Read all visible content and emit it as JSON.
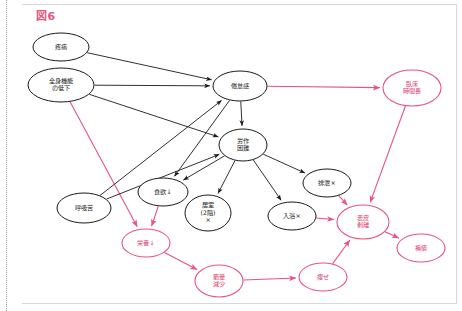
{
  "figure": {
    "label": "図6",
    "label_color": "#e8537f",
    "width": 462,
    "height": 311
  },
  "palette": {
    "black": "#1a1a1a",
    "pink": "#e8537f",
    "pink_text": "#d8406e",
    "background": "#ffffff",
    "frame": "#d8d8d8",
    "rule": "#9a9a9a"
  },
  "chart_data": {
    "type": "diagram",
    "title": "図6",
    "nodes": [
      {
        "id": "pain",
        "lines": [
          "疼痛"
        ],
        "cx": 61,
        "cy": 47,
        "rx": 28,
        "ry": 14,
        "color": "black"
      },
      {
        "id": "decline",
        "lines": [
          "全身機能",
          "の低下"
        ],
        "cx": 61,
        "cy": 85,
        "rx": 33,
        "ry": 17,
        "color": "black"
      },
      {
        "id": "fatigue",
        "lines": [
          "倦怠感"
        ],
        "cx": 240,
        "cy": 86,
        "rx": 27,
        "ry": 15,
        "color": "black"
      },
      {
        "id": "exertion",
        "lines": [
          "労作",
          "困難"
        ],
        "cx": 243,
        "cy": 145,
        "rx": 24,
        "ry": 16,
        "color": "black"
      },
      {
        "id": "bedrest",
        "lines": [
          "臥床",
          "時間長"
        ],
        "cx": 412,
        "cy": 88,
        "rx": 29,
        "ry": 18,
        "color": "pink"
      },
      {
        "id": "dyspnea",
        "lines": [
          "呼吸苦"
        ],
        "cx": 84,
        "cy": 208,
        "rx": 27,
        "ry": 15,
        "color": "black"
      },
      {
        "id": "appetite",
        "lines": [
          "食欲↓"
        ],
        "cx": 163,
        "cy": 192,
        "rx": 25,
        "ry": 14,
        "color": "black"
      },
      {
        "id": "room",
        "lines": [
          "居室",
          "(2階)",
          "×"
        ],
        "cx": 208,
        "cy": 213,
        "rx": 23,
        "ry": 18,
        "color": "black"
      },
      {
        "id": "bath",
        "lines": [
          "入浴×"
        ],
        "cx": 292,
        "cy": 216,
        "rx": 24,
        "ry": 14,
        "color": "black"
      },
      {
        "id": "toilet",
        "lines": [
          "排泄×"
        ],
        "cx": 327,
        "cy": 183,
        "rx": 24,
        "ry": 14,
        "color": "black"
      },
      {
        "id": "nutrition",
        "lines": [
          "栄養↓"
        ],
        "cx": 146,
        "cy": 243,
        "rx": 24,
        "ry": 14,
        "color": "pink"
      },
      {
        "id": "skin_tear",
        "lines": [
          "表皮",
          "剥離"
        ],
        "cx": 363,
        "cy": 222,
        "rx": 26,
        "ry": 17,
        "color": "pink"
      },
      {
        "id": "ulcer",
        "lines": [
          "褥瘡"
        ],
        "cx": 421,
        "cy": 248,
        "rx": 24,
        "ry": 14,
        "color": "pink"
      },
      {
        "id": "muscle_loss",
        "lines": [
          "筋量",
          "減少"
        ],
        "cx": 219,
        "cy": 281,
        "rx": 24,
        "ry": 16,
        "color": "pink"
      },
      {
        "id": "emaciation",
        "lines": [
          "痩せ"
        ],
        "cx": 323,
        "cy": 277,
        "rx": 24,
        "ry": 14,
        "color": "pink"
      }
    ],
    "edges": [
      {
        "from": "pain",
        "to": "fatigue",
        "color": "black"
      },
      {
        "from": "decline",
        "to": "fatigue",
        "color": "black"
      },
      {
        "from": "decline",
        "to": "exertion",
        "color": "black"
      },
      {
        "from": "decline",
        "to": "nutrition",
        "color": "pink"
      },
      {
        "from": "fatigue",
        "to": "exertion",
        "color": "black"
      },
      {
        "from": "fatigue",
        "to": "bedrest",
        "color": "pink"
      },
      {
        "from": "fatigue",
        "to": "appetite",
        "color": "black"
      },
      {
        "from": "dyspnea",
        "to": "fatigue",
        "color": "black"
      },
      {
        "from": "dyspnea",
        "to": "exertion",
        "color": "black"
      },
      {
        "from": "exertion",
        "to": "appetite",
        "color": "black"
      },
      {
        "from": "exertion",
        "to": "room",
        "color": "black"
      },
      {
        "from": "exertion",
        "to": "bath",
        "color": "black"
      },
      {
        "from": "exertion",
        "to": "toilet",
        "color": "black"
      },
      {
        "from": "appetite",
        "to": "nutrition",
        "color": "pink"
      },
      {
        "from": "nutrition",
        "to": "muscle_loss",
        "color": "pink"
      },
      {
        "from": "bedrest",
        "to": "skin_tear",
        "color": "pink"
      },
      {
        "from": "bath",
        "to": "skin_tear",
        "color": "pink"
      },
      {
        "from": "toilet",
        "to": "skin_tear",
        "color": "pink"
      },
      {
        "from": "skin_tear",
        "to": "ulcer",
        "color": "pink"
      },
      {
        "from": "muscle_loss",
        "to": "emaciation",
        "color": "pink"
      },
      {
        "from": "emaciation",
        "to": "skin_tear",
        "color": "pink"
      }
    ]
  }
}
